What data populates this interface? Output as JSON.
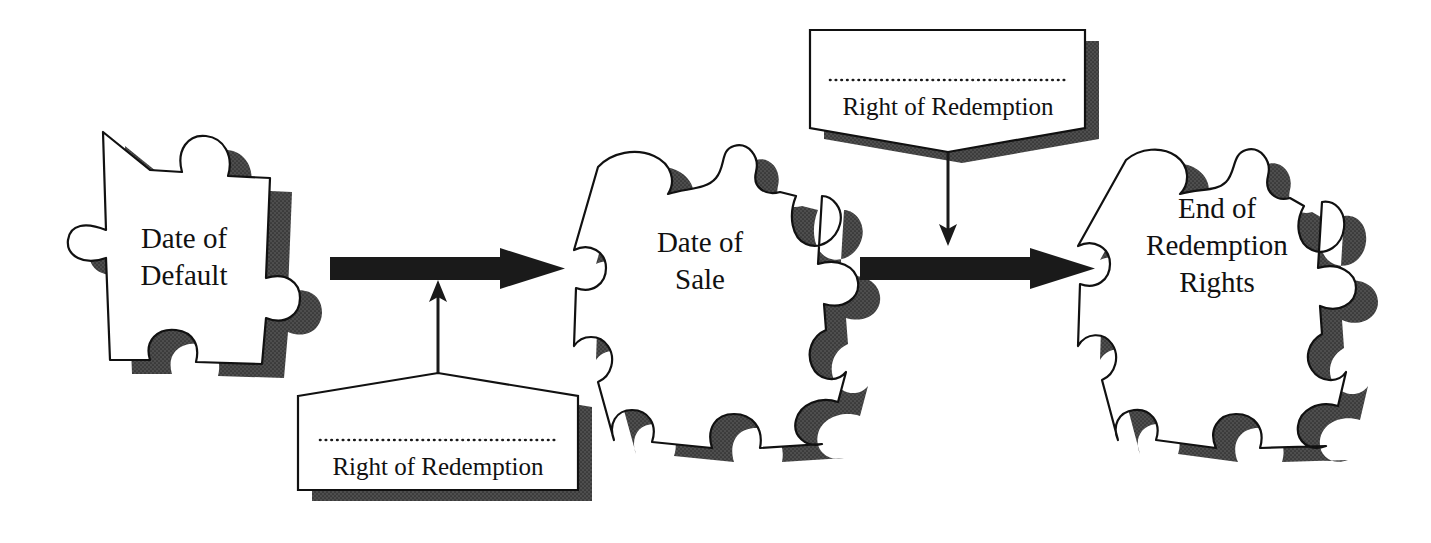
{
  "diagram": {
    "background_color": "#ffffff",
    "ink_color": "#111111",
    "shadow_color": "#4a4a4a",
    "piece_fill": "#ffffff"
  },
  "stages": [
    {
      "id": "date-of-default",
      "label_lines": [
        "Date of",
        "Default"
      ],
      "line1": "Date of",
      "line2": "Default",
      "line3": ""
    },
    {
      "id": "date-of-sale",
      "label_lines": [
        "Date of",
        "Sale"
      ],
      "line1": "Date of",
      "line2": "Sale",
      "line3": ""
    },
    {
      "id": "end-of-redemption-rights",
      "label_lines": [
        "End of",
        "Redemption",
        "Rights"
      ],
      "line1": "End of",
      "line2": "Redemption",
      "line3": "Rights"
    }
  ],
  "callouts": [
    {
      "id": "callout-bottom",
      "label": "Right of Redemption",
      "points_to": "date-of-default-to-date-of-sale",
      "direction": "up",
      "position": "bottom"
    },
    {
      "id": "callout-top",
      "label": "Right of Redemption",
      "points_to": "date-of-sale-to-end-of-redemption-rights",
      "direction": "down",
      "position": "top"
    }
  ],
  "connectors": [
    {
      "id": "arrow-1",
      "from": "date-of-default",
      "to": "date-of-sale",
      "style": "thick-right-arrow"
    },
    {
      "id": "arrow-2",
      "from": "date-of-sale",
      "to": "end-of-redemption-rights",
      "style": "thick-right-arrow"
    }
  ]
}
